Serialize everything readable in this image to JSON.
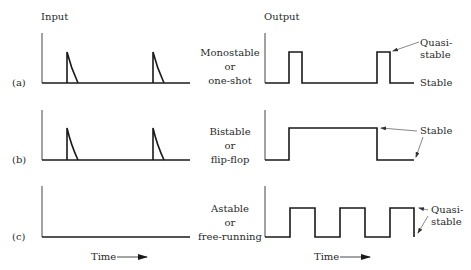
{
  "headers": {
    "input": "Input",
    "output": "Output"
  },
  "rows": [
    {
      "id": "a",
      "label": "(a)",
      "mode_line1": "Monostable",
      "mode_line2": "or",
      "mode_line3": "one-shot",
      "notes": {
        "quasi1": "Quasi-",
        "quasi2": "stable",
        "stable": "Stable"
      }
    },
    {
      "id": "b",
      "label": "(b)",
      "mode_line1": "Bistable",
      "mode_line2": "or",
      "mode_line3": "flip-flop",
      "notes": {
        "stable": "Stable"
      }
    },
    {
      "id": "c",
      "label": "(c)",
      "mode_line1": "Astable",
      "mode_line2": "or",
      "mode_line3": "free-running",
      "notes": {
        "quasi1": "Quasi-",
        "quasi2": "stable"
      }
    }
  ],
  "time_label": "Time",
  "colors": {
    "line": "#1a1a1a",
    "text": "#2a2a2a",
    "background": "#ffffff"
  }
}
